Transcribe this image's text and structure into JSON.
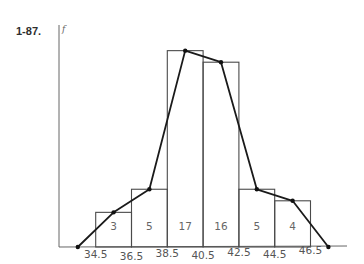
{
  "figure": {
    "label": "1-87.",
    "y_axis_label": "f"
  },
  "chart_data": {
    "type": "bar",
    "subtype": "histogram_with_frequency_polygon",
    "title": "",
    "xlabel": "",
    "ylabel": "f",
    "bin_edges": [
      34.5,
      36.5,
      38.5,
      40.5,
      42.5,
      44.5,
      46.5
    ],
    "tick_labels": [
      "34.5",
      "36.5",
      "38.5",
      "40.5",
      "42.5",
      "44.5",
      "46.5"
    ],
    "values": [
      3,
      5,
      17,
      16,
      5,
      4
    ],
    "bar_labels": [
      "3",
      "5",
      "17",
      "16",
      "5",
      "4"
    ],
    "frequency_polygon": {
      "type": "line",
      "x": [
        33.5,
        35.5,
        37.5,
        39.5,
        41.5,
        43.5,
        45.5,
        47.5
      ],
      "y": [
        0,
        3,
        5,
        17,
        16,
        5,
        4,
        0
      ]
    },
    "xlim": [
      32.5,
      48.5
    ],
    "ylim": [
      0,
      19
    ],
    "grid": false,
    "legend": null
  }
}
